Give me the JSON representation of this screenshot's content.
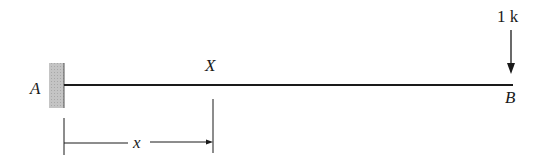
{
  "diagram": {
    "type": "cantilever-beam",
    "support_label": "A",
    "free_end_label": "B",
    "section_label": "X",
    "load": {
      "label": "1 k",
      "direction": "down"
    },
    "dimension": {
      "label": "x"
    },
    "colors": {
      "ink": "#1a1a1a",
      "wall_hatch": "#b8b8b8"
    }
  }
}
